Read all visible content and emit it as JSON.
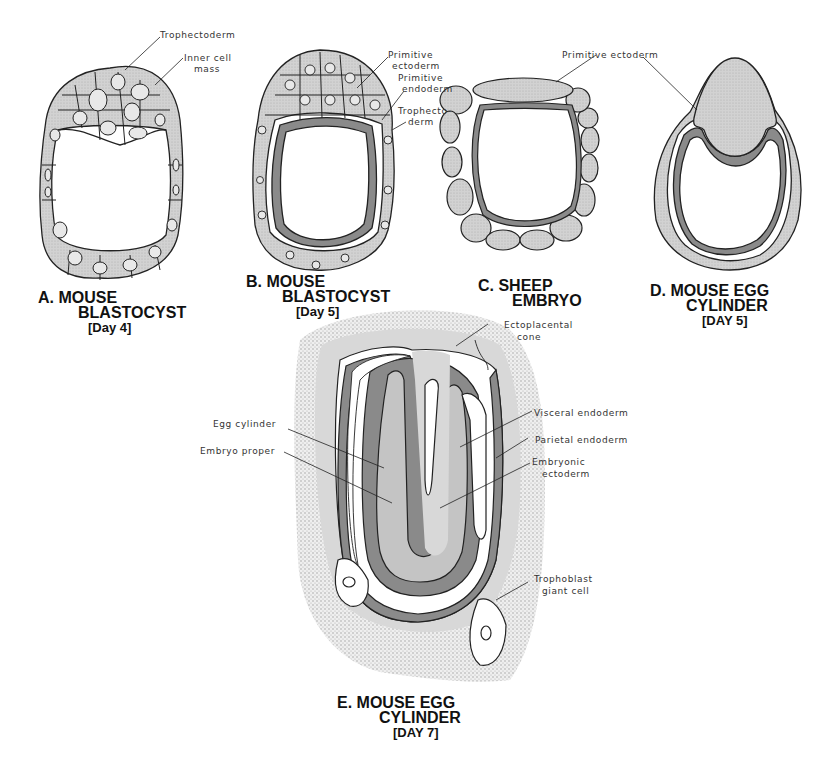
{
  "colors": {
    "ink": "#222222",
    "cell_fill": "#cfcfcf",
    "dark_layer": "#8a8a8a",
    "mid_layer": "#b9b9b9",
    "light_layer": "#d6d6d6",
    "stipple": "#e3e3e3",
    "background": "#ffffff"
  },
  "panels": [
    {
      "id": "A",
      "title_line1": "A. MOUSE",
      "title_line2": "BLASTOCYST",
      "title_line3": "[Day 4]",
      "labels": [
        "Trophectoderm",
        "Inner cell",
        "mass"
      ]
    },
    {
      "id": "B",
      "title_line1": "B. MOUSE",
      "title_line2": "BLASTOCYST",
      "title_line3": "[Day 5]",
      "labels": [
        "Primitive",
        "ectoderm",
        "Primitive",
        "endoderm",
        "Trophecto-",
        "derm"
      ]
    },
    {
      "id": "C",
      "title_line1": "C. SHEEP",
      "title_line2": "EMBRYO",
      "labels": [
        "Primitive ectoderm"
      ]
    },
    {
      "id": "D",
      "title_line1": "D. MOUSE EGG",
      "title_line2": "CYLINDER",
      "title_line3": "[DAY 5]"
    },
    {
      "id": "E",
      "title_line1": "E. MOUSE EGG",
      "title_line2": "CYLINDER",
      "title_line3": "[DAY 7]",
      "labels": [
        "Ectoplacental",
        "cone",
        "Egg cylinder",
        "Embryo proper",
        "Visceral endoderm",
        "Parietal endoderm",
        "Embryonic",
        "ectoderm",
        "Trophoblast",
        "giant cell"
      ]
    }
  ]
}
